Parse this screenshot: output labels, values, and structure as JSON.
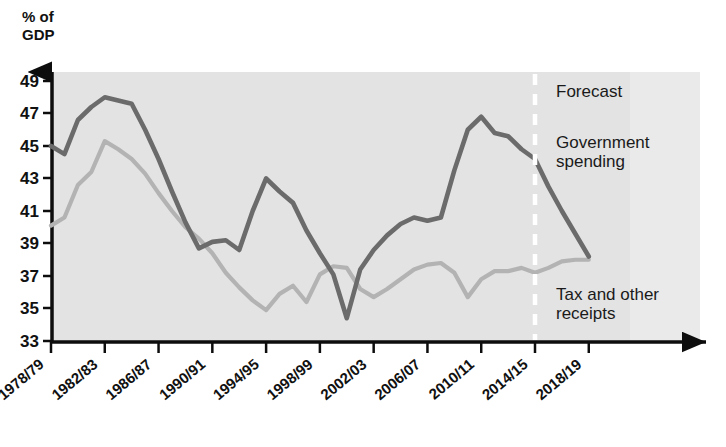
{
  "chart_data": {
    "type": "line",
    "title": "",
    "ylabel": "% of GDP",
    "xlabel": "",
    "ylim": [
      33,
      49
    ],
    "ytick_values": [
      33,
      35,
      37,
      39,
      41,
      43,
      45,
      47,
      49
    ],
    "ytick_labels": [
      "33",
      "35",
      "37",
      "39",
      "41",
      "43",
      "45",
      "47",
      "49"
    ],
    "grid": false,
    "legend_position": "inline-annotations",
    "x": [
      "1978/79",
      "1979/80",
      "1980/81",
      "1981/82",
      "1982/83",
      "1983/84",
      "1984/85",
      "1985/86",
      "1986/87",
      "1987/88",
      "1988/89",
      "1989/90",
      "1990/91",
      "1991/92",
      "1992/93",
      "1993/94",
      "1994/95",
      "1995/96",
      "1996/97",
      "1997/98",
      "1998/99",
      "1999/00",
      "2000/01",
      "2001/02",
      "2002/03",
      "2003/04",
      "2004/05",
      "2005/06",
      "2006/07",
      "2007/08",
      "2008/09",
      "2009/10",
      "2010/11",
      "2011/12",
      "2012/13",
      "2013/14",
      "2014/15",
      "2015/16",
      "2016/17",
      "2017/18",
      "2018/19"
    ],
    "xtick_labels": [
      "1978/79",
      "1982/83",
      "1986/87",
      "1990/91",
      "1994/95",
      "1998/99",
      "2002/03",
      "2006/07",
      "2010/11",
      "2014/15",
      "2018/19"
    ],
    "series": [
      {
        "name": "Government spending",
        "color": "#6b6b6b",
        "values": [
          45.0,
          44.5,
          46.6,
          47.4,
          48.0,
          47.8,
          47.6,
          46.0,
          44.2,
          42.2,
          40.3,
          38.7,
          39.1,
          39.2,
          38.6,
          41.0,
          43.0,
          42.2,
          41.5,
          39.8,
          38.4,
          37.1,
          34.4,
          37.4,
          38.6,
          39.5,
          40.2,
          40.6,
          40.4,
          40.6,
          43.5,
          46.0,
          46.8,
          45.8,
          45.6,
          44.8,
          44.2,
          42.5,
          41.0,
          39.6,
          38.2
        ]
      },
      {
        "name": "Tax and other receipts",
        "color": "#b3b3b3",
        "values": [
          40.1,
          40.6,
          42.6,
          43.4,
          45.3,
          44.8,
          44.2,
          43.3,
          42.1,
          41.0,
          40.0,
          39.3,
          38.4,
          37.2,
          36.3,
          35.5,
          34.9,
          35.9,
          36.4,
          35.4,
          37.1,
          37.6,
          37.5,
          36.2,
          35.7,
          36.2,
          36.8,
          37.4,
          37.7,
          37.8,
          37.2,
          35.7,
          36.8,
          37.3,
          37.3,
          37.5,
          37.2,
          37.5,
          37.9,
          38.0,
          38.0
        ]
      }
    ],
    "annotations": [
      {
        "name": "forecast",
        "text": "Forecast",
        "x": "2015/16",
        "y": 47.8
      },
      {
        "name": "government-spending",
        "text": "Government spending",
        "x": "2015/16",
        "y": 45.2
      },
      {
        "name": "tax-and-other-receipts",
        "text": "Tax and other receipts",
        "x": "2015/16",
        "y": 35.5
      }
    ],
    "forecast_divider": {
      "x": "2014/15",
      "style": "dashed",
      "color": "#ffffff"
    }
  },
  "axis": {
    "y_label_line1": "% of",
    "y_label_line2": "GDP"
  },
  "annotations": {
    "forecast": "Forecast",
    "gov_spending_line1": "Government",
    "gov_spending_line2": "spending",
    "tax_line1": "Tax and other",
    "tax_line2": "receipts"
  },
  "colors": {
    "government_spending": "#6b6b6b",
    "tax_receipts": "#b3b3b3",
    "plot_background": "#e3e3e3",
    "axis": "#0d0d0d",
    "forecast_divider": "#ffffff"
  }
}
